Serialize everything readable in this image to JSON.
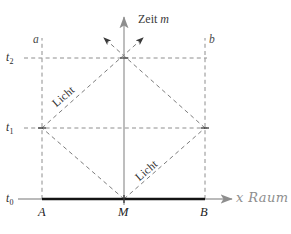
{
  "figure": {
    "kind": "minkowski-spacetime-diagram",
    "language": "de"
  },
  "axes": {
    "vertical": {
      "label_text": "Zeit",
      "label_symbol": "m",
      "name": "time-axis",
      "color": "#9a9a9a"
    },
    "horizontal": {
      "label_text": "x",
      "label_symbol": "Raum",
      "name": "space-axis",
      "color": "#9a9a9a"
    }
  },
  "ticks": {
    "t0": {
      "base": "t",
      "sub": "0"
    },
    "t1": {
      "base": "t",
      "sub": "1"
    },
    "t2": {
      "base": "t",
      "sub": "2"
    }
  },
  "worldlines": {
    "left": "a",
    "right": "b"
  },
  "points": {
    "left": "A",
    "middle": "M",
    "right": "B"
  },
  "light_rays": {
    "upper_left": "Licht",
    "lower_right": "Licht"
  },
  "colors": {
    "axis": "#9a9a9a",
    "dashed": "#8a8a8a",
    "rod": "#1a1a1a",
    "text": "#2b2b2b",
    "raum_text": "#8e8e8e"
  },
  "geometry": {
    "x_M": 124,
    "x_a": 42,
    "x_b": 205,
    "y_t0": 199,
    "y_t1": 128,
    "y_t2": 58
  }
}
